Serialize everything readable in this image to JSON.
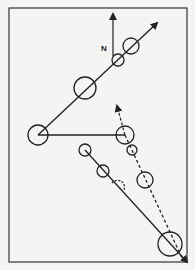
{
  "diagram": {
    "north_label": "N",
    "colors": {
      "ink": "#222222",
      "paper": "#f4f4f2",
      "frame": "#333333"
    },
    "frame": {
      "x": 9,
      "y": 8,
      "w": 178,
      "h": 254
    },
    "north_arrow": {
      "x": 113,
      "y1": 56,
      "y2": 14
    },
    "solid_path_upper": {
      "points": [
        [
          38,
          135
        ],
        [
          157,
          23
        ]
      ],
      "circles": [
        {
          "cx": 85,
          "cy": 88,
          "r": 11
        },
        {
          "cx": 118,
          "cy": 60,
          "r": 6
        },
        {
          "cx": 131,
          "cy": 46,
          "r": 8
        }
      ]
    },
    "horizontal_link": {
      "points": [
        [
          38,
          135
        ],
        [
          125,
          135
        ]
      ],
      "circles": [
        {
          "cx": 38,
          "cy": 135,
          "r": 10
        },
        {
          "cx": 125,
          "cy": 135,
          "r": 9
        }
      ]
    },
    "dashed_arrow_up": {
      "points": [
        [
          125,
          135
        ],
        [
          117,
          108
        ]
      ]
    },
    "dashed_path": {
      "points": [
        [
          125,
          135
        ],
        [
          182,
          258
        ]
      ],
      "circles": [
        {
          "cx": 132,
          "cy": 150,
          "r": 5
        },
        {
          "cx": 145,
          "cy": 180,
          "r": 8
        }
      ]
    },
    "solid_path_lower": {
      "points": [
        [
          85,
          150
        ],
        [
          187,
          262
        ]
      ],
      "circles": [
        {
          "cx": 85,
          "cy": 150,
          "r": 6
        },
        {
          "cx": 103,
          "cy": 171,
          "r": 6
        },
        {
          "cx": 170,
          "cy": 244,
          "r": 12
        }
      ],
      "dashed_arc": {
        "cx": 118,
        "cy": 186,
        "r": 6
      }
    }
  }
}
